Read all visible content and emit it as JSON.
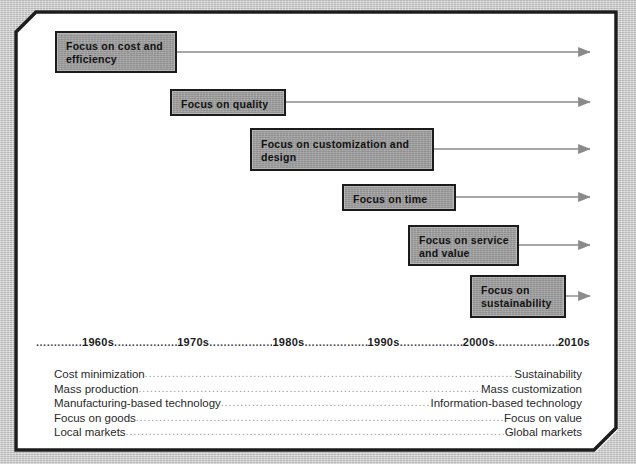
{
  "figure": {
    "background_color": "#c8c8c8",
    "frame_color": "#ffffff",
    "box_fill": "#9d9d9d",
    "box_border": "#1b1b1b",
    "arrow_color": "#8a8a8a"
  },
  "focus_boxes": [
    {
      "label": "Focus on cost and efficiency",
      "x": 55,
      "y": 31,
      "w": 122,
      "h": 42
    },
    {
      "label": "Focus on quality",
      "x": 170,
      "y": 89,
      "w": 116,
      "h": 27
    },
    {
      "label": "Focus on customization and design",
      "x": 250,
      "y": 128,
      "w": 184,
      "h": 43
    },
    {
      "label": "Focus on time",
      "x": 342,
      "y": 184,
      "w": 114,
      "h": 27
    },
    {
      "label": "Focus on service and value",
      "x": 408,
      "y": 225,
      "w": 111,
      "h": 41
    },
    {
      "label": "Focus on sustainability",
      "x": 470,
      "y": 275,
      "w": 96,
      "h": 43
    }
  ],
  "arrows": [
    {
      "y": 52,
      "x_start": 177,
      "x_end": 596
    },
    {
      "y": 102,
      "x_start": 286,
      "x_end": 596
    },
    {
      "y": 149,
      "x_start": 434,
      "x_end": 596
    },
    {
      "y": 197,
      "x_start": 456,
      "x_end": 596
    },
    {
      "y": 245,
      "x_start": 519,
      "x_end": 596
    },
    {
      "y": 296,
      "x_start": 566,
      "x_end": 596
    }
  ],
  "timeline": {
    "decades": [
      "1960s",
      "1970s",
      "1980s",
      "1990s",
      "2000s",
      "2010s"
    ],
    "leader": "........................................................"
  },
  "transitions": {
    "dots": "................................................................................................................................",
    "rows": [
      {
        "from": "Cost minimization",
        "to": "Sustainability"
      },
      {
        "from": "Mass production",
        "to": "Mass customization"
      },
      {
        "from": "Manufacturing-based technology",
        "to": "Information-based technology"
      },
      {
        "from": "Focus on goods",
        "to": "Focus on value"
      },
      {
        "from": "Local markets",
        "to": "Global markets"
      }
    ]
  }
}
